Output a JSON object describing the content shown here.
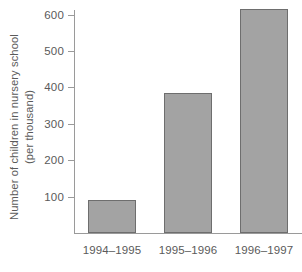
{
  "chart_data": {
    "type": "bar",
    "title": "",
    "subtitle": "",
    "categories": [
      "1994–1995",
      "1995–1996",
      "1996–1997"
    ],
    "values": [
      90,
      385,
      615
    ],
    "xlabel": "",
    "ylabel_line1": "Number of children in nursery school",
    "ylabel_line2": "(per thousand)",
    "ytick_labels": [
      "100",
      "200",
      "300",
      "400",
      "500",
      "600"
    ],
    "ytick_values": [
      100,
      200,
      300,
      400,
      500,
      600
    ],
    "ylim": [
      0,
      640
    ],
    "grid": false,
    "legend": false,
    "legend_position": "none",
    "bar_fill_color": "#a3a3a3",
    "bar_border_color": "#6e6e6e",
    "axis_color": "#9a9a9a",
    "text_color": "#5a5a5a",
    "background_color": "#ffffff"
  }
}
